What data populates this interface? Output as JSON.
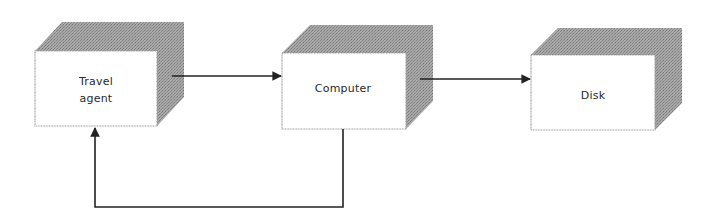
{
  "diagram": {
    "type": "flow-diagram",
    "colors": {
      "background": "#ffffff",
      "box_face": "#ffffff",
      "box_border": "#9a9a9a",
      "box_shadow": "#9b9b9b",
      "line": "#222222"
    },
    "nodes": [
      {
        "id": "travel_agent",
        "label_line1": "Travel",
        "label_line2": "agent"
      },
      {
        "id": "computer",
        "label": "Computer"
      },
      {
        "id": "disk",
        "label": "Disk"
      }
    ],
    "edges": [
      {
        "from": "travel_agent",
        "to": "computer"
      },
      {
        "from": "computer",
        "to": "disk"
      },
      {
        "from": "computer",
        "to": "travel_agent",
        "route": "below"
      }
    ]
  }
}
